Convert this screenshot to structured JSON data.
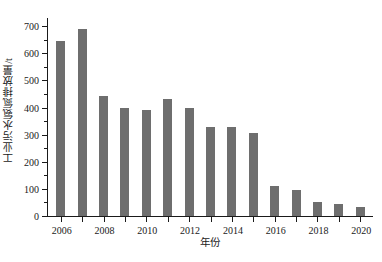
{
  "chart_data": {
    "type": "bar",
    "title": "",
    "xlabel": "年份",
    "ylabel": "工业污水氨氮排放量/t",
    "categories": [
      "2006",
      "2007",
      "2008",
      "2009",
      "2010",
      "2011",
      "2012",
      "2013",
      "2014",
      "2015",
      "2016",
      "2017",
      "2018",
      "2019",
      "2020"
    ],
    "values": [
      645,
      690,
      443,
      398,
      390,
      432,
      398,
      329,
      327,
      305,
      112,
      95,
      52,
      44,
      32
    ],
    "series": [
      {
        "name": "工业污水氨氮排放量",
        "values": [
          645,
          690,
          443,
          398,
          390,
          432,
          398,
          329,
          327,
          305,
          112,
          95,
          52,
          44,
          32
        ]
      }
    ],
    "ylim": [
      0,
      730
    ],
    "xlim": [
      2005.4,
      2020.6
    ],
    "y_ticks": [
      0,
      100,
      200,
      300,
      400,
      500,
      600,
      700
    ],
    "y_tick_labels": [
      "0",
      "100",
      "200",
      "300",
      "400",
      "500",
      "600",
      "700"
    ],
    "y_minor_ticks": [
      50,
      150,
      250,
      350,
      450,
      550,
      650
    ],
    "x_ticks": [
      2006,
      2008,
      2010,
      2012,
      2014,
      2016,
      2018,
      2020
    ],
    "x_tick_labels": [
      "2006",
      "2008",
      "2010",
      "2012",
      "2014",
      "2016",
      "2018",
      "2020"
    ],
    "grid": false,
    "legend": null,
    "bar_color": "#6e6e6e",
    "axis_color": "#1a1a1a",
    "background_color": "#ffffff"
  }
}
